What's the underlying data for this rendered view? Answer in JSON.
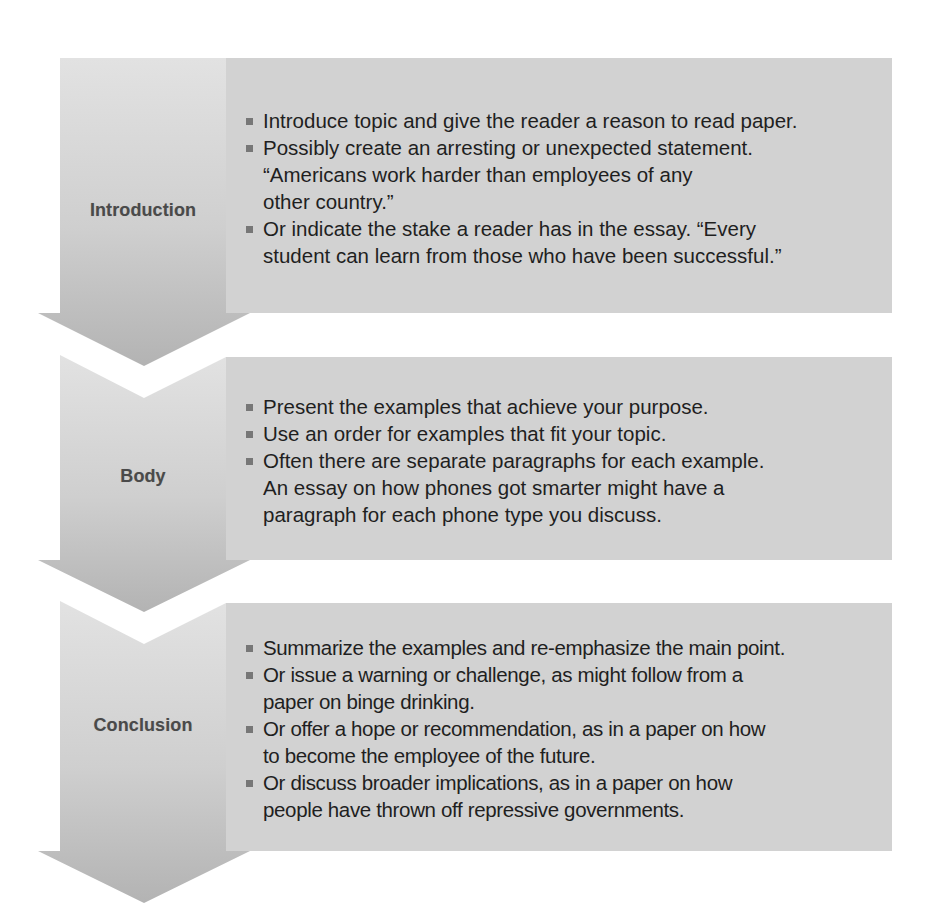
{
  "colors": {
    "background": "#ffffff",
    "arrow_light": "#dadada",
    "arrow_dark": "#b7b7b7",
    "content_box": "#d2d2d2",
    "label_text": "#4a4a4a",
    "body_text": "#1f1f1f",
    "bullet": "#777777"
  },
  "stages": [
    {
      "label": "Introduction",
      "bullets": [
        {
          "lines": [
            "Introduce topic and give the reader a reason to read paper."
          ]
        },
        {
          "lines": [
            "Possibly create an arresting or unexpected statement.",
            "“Americans work harder than employees of any",
            "other country.”"
          ]
        },
        {
          "lines": [
            "Or indicate the stake a reader has in the essay. “Every",
            "student can learn from those who have been successful.”"
          ]
        }
      ]
    },
    {
      "label": "Body",
      "bullets": [
        {
          "lines": [
            "Present the examples that achieve your purpose."
          ]
        },
        {
          "lines": [
            "Use an order for examples that fit your topic."
          ]
        },
        {
          "lines": [
            "Often there are separate paragraphs for each example.",
            "An essay on how phones got smarter might have a",
            "paragraph for each phone type you discuss."
          ]
        }
      ]
    },
    {
      "label": "Conclusion",
      "bullets": [
        {
          "lines": [
            "Summarize the examples and re-emphasize the main point."
          ]
        },
        {
          "lines": [
            "Or issue a warning or challenge, as might follow from a",
            "paper on binge drinking."
          ]
        },
        {
          "lines": [
            "Or offer a hope or recommendation, as in a paper on how",
            "to become the employee of the future."
          ]
        },
        {
          "lines": [
            "Or discuss broader implications, as in a paper on how",
            "people have thrown off repressive governments."
          ]
        }
      ]
    }
  ]
}
